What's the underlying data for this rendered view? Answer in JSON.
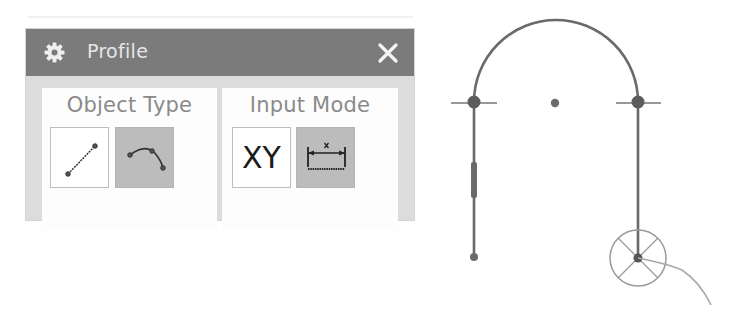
{
  "dialog": {
    "title": "Profile",
    "title_icon": "gear-icon",
    "close_icon": "close-icon",
    "colors": {
      "titlebar": "#7b7b7b",
      "body": "#dcdcdc",
      "panel": "#fdfdfd",
      "selected_button": "#bcbcbc"
    },
    "groups": [
      {
        "label": "Object Type",
        "buttons": [
          {
            "name": "line",
            "icon": "line-icon",
            "selected": false
          },
          {
            "name": "arc",
            "icon": "arc-icon",
            "selected": true
          }
        ]
      },
      {
        "label": "Input Mode",
        "buttons": [
          {
            "name": "coordinate-mode",
            "text": "XY",
            "selected": false
          },
          {
            "name": "parameter-mode",
            "icon": "dimension-icon",
            "selected": true
          }
        ]
      }
    ]
  },
  "sketch": {
    "stroke_color": "#6a6a6a",
    "elements": [
      "left-vertical-line",
      "arc",
      "right-vertical-line",
      "arc-center-point",
      "cursor-snap-circle",
      "cursor-trail"
    ]
  }
}
